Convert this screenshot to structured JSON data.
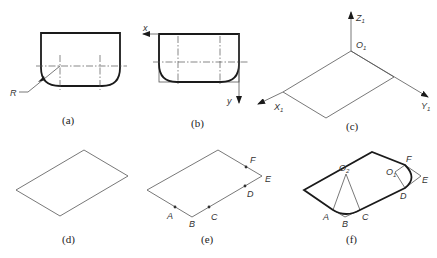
{
  "figure": {
    "panels": [
      {
        "id": "a",
        "caption": "(a)",
        "labels": {
          "radius": "R"
        }
      },
      {
        "id": "b",
        "caption": "(b)",
        "labels": {
          "x_axis": "x",
          "y_axis": "y"
        }
      },
      {
        "id": "c",
        "caption": "(c)",
        "labels": {
          "z_axis": "Z",
          "z_sub": "1",
          "origin": "O",
          "origin_sub": "1",
          "x_axis": "X",
          "x_sub": "1",
          "y_axis": "Y",
          "y_sub": "1"
        }
      },
      {
        "id": "d",
        "caption": "(d)",
        "labels": {}
      },
      {
        "id": "e",
        "caption": "(e)",
        "labels": {
          "A": "A",
          "B": "B",
          "C": "C",
          "D": "D",
          "E": "E",
          "F": "F"
        }
      },
      {
        "id": "f",
        "caption": "(f)",
        "labels": {
          "A": "A",
          "B": "B",
          "C": "C",
          "D": "D",
          "E": "E",
          "F": "F",
          "O2": "O",
          "O2_sub": "2",
          "O1": "O",
          "O1_sub": "1"
        }
      }
    ]
  }
}
